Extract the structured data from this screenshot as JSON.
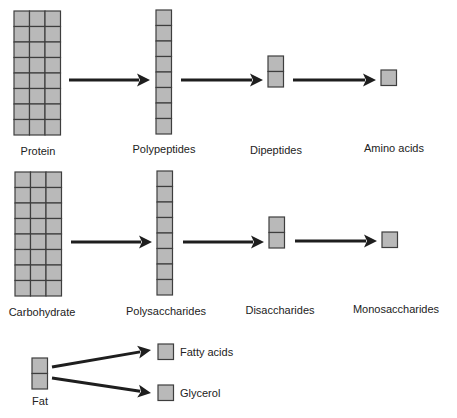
{
  "diagram": {
    "colors": {
      "cell_fill": "#b9b9b9",
      "cell_stroke": "#3e3e3e",
      "arrow": "#1e1e1e",
      "text": "#222222"
    },
    "rows": [
      {
        "name": "protein",
        "stages": [
          {
            "label": "Protein",
            "cols": 3,
            "rows": 8
          },
          {
            "label": "Polypeptides",
            "cols": 1,
            "rows": 8
          },
          {
            "label": "Dipeptides",
            "cols": 1,
            "rows": 2
          },
          {
            "label": "Amino acids",
            "cols": 1,
            "rows": 1
          }
        ]
      },
      {
        "name": "carbohydrate",
        "stages": [
          {
            "label": "Carbohydrate",
            "cols": 3,
            "rows": 8
          },
          {
            "label": "Polysaccharides",
            "cols": 1,
            "rows": 8
          },
          {
            "label": "Disaccharides",
            "cols": 1,
            "rows": 2
          },
          {
            "label": "Monosaccharides",
            "cols": 1,
            "rows": 1
          }
        ]
      }
    ],
    "fat": {
      "source": {
        "label": "Fat",
        "cols": 1,
        "rows": 2
      },
      "products": [
        {
          "label": "Fatty acids",
          "cols": 1,
          "rows": 1
        },
        {
          "label": "Glycerol",
          "cols": 1,
          "rows": 1
        }
      ]
    }
  }
}
